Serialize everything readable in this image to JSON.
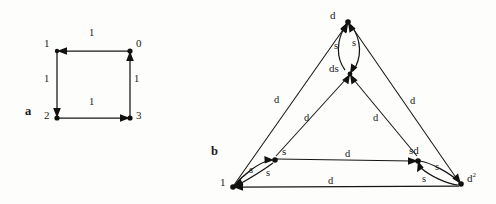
{
  "figure": {
    "background_color": "#fdfdfc",
    "ink_color": "#161616",
    "panels": [
      {
        "id": "a",
        "label": "a"
      },
      {
        "id": "b",
        "label": "b"
      }
    ]
  },
  "panel_a": {
    "label": "a",
    "description": "directed 4-cycle square graph with unit weights",
    "nodes": [
      {
        "id": "n0",
        "label": "0",
        "x": 130,
        "y": 51,
        "label_x": 136,
        "label_y": 44
      },
      {
        "id": "n1",
        "label": "1",
        "x": 57,
        "y": 51,
        "label_x": 44,
        "label_y": 44
      },
      {
        "id": "n2",
        "label": "2",
        "x": 57,
        "y": 118,
        "label_x": 44,
        "label_y": 111
      },
      {
        "id": "n3",
        "label": "3",
        "x": 130,
        "y": 118,
        "label_x": 136,
        "label_y": 111
      }
    ],
    "edges": [
      {
        "id": "e0",
        "from": "0",
        "to": "1",
        "label": "1",
        "label_x": 91,
        "label_y": 31,
        "orientation": "top-leftward"
      },
      {
        "id": "e1",
        "from": "1",
        "to": "2",
        "label": "1",
        "label_x": 45,
        "label_y": 78,
        "orientation": "left-downward"
      },
      {
        "id": "e2",
        "from": "2",
        "to": "3",
        "label": "1",
        "label_x": 91,
        "label_y": 101,
        "orientation": "bottom-rightward"
      },
      {
        "id": "e3",
        "from": "3",
        "to": "0",
        "label": "1",
        "label_x": 135,
        "label_y": 78,
        "orientation": "right-upward"
      }
    ]
  },
  "panel_b": {
    "label": "b",
    "description": "Cayley-style triangular graph with doubled curved edges",
    "nodes": [
      {
        "id": "b_top",
        "label": "d",
        "x": 348,
        "y": 22,
        "label_x": 332,
        "label_y": 15
      },
      {
        "id": "b_mid",
        "label": "ds",
        "x": 350,
        "y": 74,
        "label_x": 331,
        "label_y": 68
      },
      {
        "id": "b_left",
        "label": "1",
        "x": 233,
        "y": 187,
        "label_x": 222,
        "label_y": 181
      },
      {
        "id": "b_s",
        "label": "s",
        "x": 274,
        "y": 160,
        "label_x": 283,
        "label_y": 151
      },
      {
        "id": "b_sd",
        "label": "sd",
        "x": 418,
        "y": 161,
        "label_x": 411,
        "label_y": 150
      },
      {
        "id": "b_right",
        "label": "d",
        "superscript": "2",
        "x": 461,
        "y": 184,
        "label_x": 468,
        "label_y": 175
      }
    ],
    "edges": [
      {
        "id": "be1",
        "from": "d",
        "to": "ds",
        "label": "s",
        "label_x": 336,
        "label_y": 45,
        "kind": "curve-left"
      },
      {
        "id": "be2",
        "from": "ds",
        "to": "d",
        "label": "s",
        "label_x": 354,
        "label_y": 42,
        "kind": "curve-right"
      },
      {
        "id": "be3",
        "from": "1",
        "to": "d",
        "label": "d",
        "label_x": 277,
        "label_y": 99,
        "kind": "outer-left"
      },
      {
        "id": "be4",
        "from": "d2",
        "to": "d",
        "label": "d",
        "label_x": 413,
        "label_y": 100,
        "kind": "outer-right"
      },
      {
        "id": "be5",
        "from": "s",
        "to": "ds",
        "label": "d",
        "label_x": 307,
        "label_y": 117,
        "kind": "inner-left"
      },
      {
        "id": "be6",
        "from": "sd",
        "to": "ds",
        "label": "d",
        "label_x": 376,
        "label_y": 117,
        "kind": "inner-right"
      },
      {
        "id": "be7",
        "from": "1",
        "to": "s",
        "label": "s",
        "label_x": 251,
        "label_y": 169,
        "kind": "curve-lower"
      },
      {
        "id": "be8",
        "from": "s",
        "to": "1",
        "label": "s",
        "label_x": 268,
        "label_y": 172,
        "kind": "curve-upper"
      },
      {
        "id": "be9",
        "from": "s",
        "to": "sd",
        "label": "d",
        "label_x": 348,
        "label_y": 153,
        "kind": "middle-horizontal"
      },
      {
        "id": "be10",
        "from": "sd",
        "to": "d2",
        "label": "s",
        "label_x": 437,
        "label_y": 166,
        "kind": "curve-upper"
      },
      {
        "id": "be11",
        "from": "d2",
        "to": "sd",
        "label": "s",
        "label_x": 424,
        "label_y": 178,
        "kind": "curve-lower"
      },
      {
        "id": "be12",
        "from": "d2",
        "to": "1",
        "label": "d",
        "label_x": 330,
        "label_y": 180,
        "kind": "bottom-horizontal"
      }
    ]
  }
}
